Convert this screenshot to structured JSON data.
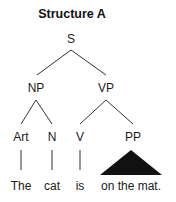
{
  "title": "Structure A",
  "nodes": {
    "s": "S",
    "np": "NP",
    "vp": "VP",
    "art": "Art",
    "n": "N",
    "v": "V",
    "pp": "PP"
  },
  "words": {
    "the": "The",
    "cat": "cat",
    "is": "is",
    "pp_phrase": "on the mat."
  },
  "colors": {
    "line": "#333333",
    "triangle": "#111111",
    "text": "#1a1a1a"
  }
}
